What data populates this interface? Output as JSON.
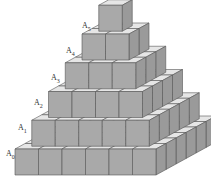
{
  "diagram": {
    "colors": {
      "front": "#a9a9a9",
      "side": "#9a9a9a",
      "top": "#e6e6e6",
      "edge": "#555555",
      "background": "#ffffff"
    },
    "layers": [
      {
        "label_main": "A",
        "label_sub": "0",
        "cubes_front": 6,
        "cubes_side": 6
      },
      {
        "label_main": "A",
        "label_sub": "1",
        "cubes_front": 5,
        "cubes_side": 5
      },
      {
        "label_main": "A",
        "label_sub": "2",
        "cubes_front": 4,
        "cubes_side": 4
      },
      {
        "label_main": "A",
        "label_sub": "3",
        "cubes_front": 3,
        "cubes_side": 3
      },
      {
        "label_main": "A",
        "label_sub": "4",
        "cubes_front": 2,
        "cubes_side": 2
      },
      {
        "label_main": "A",
        "label_sub": "5",
        "cubes_front": 1,
        "cubes_side": 1
      }
    ]
  }
}
